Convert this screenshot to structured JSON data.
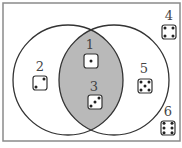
{
  "diagram": {
    "type": "venn",
    "universe_box": {
      "x": 3,
      "y": 3,
      "w": 177,
      "h": 138,
      "stroke": "#8a8a8a"
    },
    "circles": [
      {
        "id": "left",
        "cx": 68,
        "cy": 80,
        "r": 55
      },
      {
        "id": "right",
        "cx": 114,
        "cy": 80,
        "r": 55
      }
    ],
    "intersection_fill": "#b9b9b9",
    "line_color": "#333333",
    "elements": [
      {
        "label": "1",
        "pips": 1,
        "region": "intersection",
        "lx": 90,
        "ly": 49,
        "dx": 91,
        "dy": 61
      },
      {
        "label": "2",
        "pips": 2,
        "region": "left-only",
        "lx": 40,
        "ly": 71,
        "dx": 40,
        "dy": 83
      },
      {
        "label": "3",
        "pips": 3,
        "region": "intersection",
        "lx": 94,
        "ly": 91,
        "dx": 95,
        "dy": 102
      },
      {
        "label": "4",
        "pips": 4,
        "region": "outside",
        "lx": 169,
        "ly": 20,
        "dx": 169,
        "dy": 32
      },
      {
        "label": "5",
        "pips": 5,
        "region": "right-only",
        "lx": 144,
        "ly": 73,
        "dx": 145,
        "dy": 86
      },
      {
        "label": "6",
        "pips": 6,
        "region": "outside",
        "lx": 168,
        "ly": 116,
        "dx": 168,
        "dy": 128
      }
    ]
  }
}
